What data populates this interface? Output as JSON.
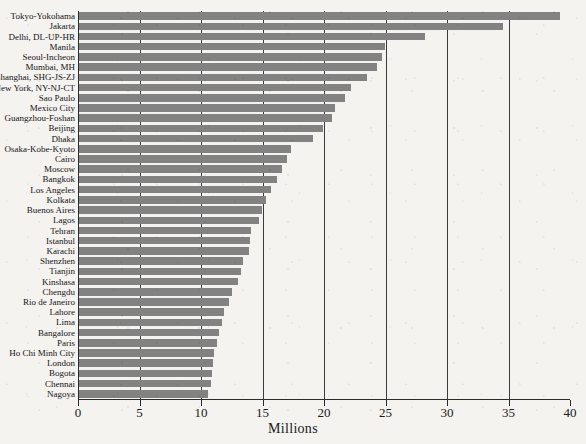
{
  "chart_data": {
    "type": "bar",
    "orientation": "horizontal",
    "title": "",
    "xlabel": "Millions",
    "ylabel": "",
    "xlim": [
      0,
      40
    ],
    "xticks": [
      0,
      5,
      10,
      15,
      20,
      25,
      30,
      35,
      40
    ],
    "xtick_labels": [
      "0",
      "5",
      "10",
      "15",
      "20",
      "25",
      "30",
      "35",
      "40"
    ],
    "grid": true,
    "grid_axis": "x",
    "legend": false,
    "bar_color": "#828282",
    "categories": [
      "Tokyo-Yokohama",
      "Jakarta",
      "Delhi, DL-UP-HR",
      "Manila",
      "Seoul-Incheon",
      "Mumbai, MH",
      "Shanghai, SHG-JS-ZJ",
      "New York, NY-NJ-CT",
      "Sao Paulo",
      "Mexico City",
      "Guangzhou-Foshan",
      "Beijing",
      "Dhaka",
      "Osaka-Kobe-Kyoto",
      "Cairo",
      "Moscow",
      "Bangkok",
      "Los Angeles",
      "Kolkata",
      "Buenos Aires",
      "Lagos",
      "Tehran",
      "Istanbul",
      "Karachi",
      "Shenzhen",
      "Tianjin",
      "Kinshasa",
      "Chengdu",
      "Rio de Janeiro",
      "Lahore",
      "Lima",
      "Bangalore",
      "Paris",
      "Ho Chi Minh City",
      "London",
      "Bogota",
      "Chennai",
      "Nagoya"
    ],
    "values": [
      39.1,
      34.5,
      28.1,
      24.9,
      24.6,
      24.2,
      23.4,
      22.1,
      21.6,
      20.8,
      20.6,
      19.8,
      19.0,
      17.2,
      16.9,
      16.5,
      16.1,
      15.6,
      15.2,
      14.9,
      14.6,
      14.0,
      13.9,
      13.8,
      13.3,
      13.2,
      12.9,
      12.4,
      12.2,
      11.8,
      11.6,
      11.4,
      11.2,
      11.0,
      10.9,
      10.8,
      10.7,
      10.5
    ]
  }
}
